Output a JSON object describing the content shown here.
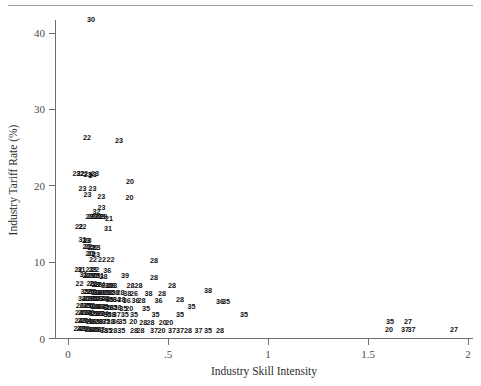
{
  "figure": {
    "top_rule": true,
    "background_color": "#ffffff",
    "marker_color": "#111111",
    "axis_color": "#6f6f6f"
  },
  "chart_data": {
    "type": "scatter",
    "title": "",
    "subtitle": "",
    "xlabel": "Industry Skill Intensity",
    "ylabel": "Industry Tariff Rate (%)",
    "xlim": [
      0,
      2
    ],
    "ylim": [
      0,
      44
    ],
    "grid": false,
    "legend": null,
    "marker_style": "text-label",
    "marker_note": "Each observation is plotted as its 2-digit industry code rather than a symbol",
    "xticks": [
      0,
      0.5,
      1,
      1.5,
      2
    ],
    "xticklabels": [
      "0",
      ".5",
      "1",
      "1.5",
      "2"
    ],
    "yticks": [
      0,
      10,
      20,
      30,
      40
    ],
    "yticklabels": [
      "0",
      "10",
      "20",
      "30",
      "40"
    ],
    "points": [
      {
        "x": 0.115,
        "y": 41.8,
        "label": "30"
      },
      {
        "x": 0.095,
        "y": 26.3,
        "label": "22"
      },
      {
        "x": 0.255,
        "y": 25.9,
        "label": "23"
      },
      {
        "x": 0.042,
        "y": 21.6,
        "label": "23"
      },
      {
        "x": 0.062,
        "y": 21.6,
        "label": "22"
      },
      {
        "x": 0.08,
        "y": 21.6,
        "label": "22"
      },
      {
        "x": 0.098,
        "y": 21.5,
        "label": "23"
      },
      {
        "x": 0.113,
        "y": 21.4,
        "label": "2"
      },
      {
        "x": 0.124,
        "y": 21.5,
        "label": "23"
      },
      {
        "x": 0.135,
        "y": 21.6,
        "label": "23"
      },
      {
        "x": 0.31,
        "y": 20.6,
        "label": "20"
      },
      {
        "x": 0.072,
        "y": 19.6,
        "label": "23"
      },
      {
        "x": 0.122,
        "y": 19.6,
        "label": "23"
      },
      {
        "x": 0.098,
        "y": 18.9,
        "label": "23"
      },
      {
        "x": 0.166,
        "y": 18.6,
        "label": "23"
      },
      {
        "x": 0.308,
        "y": 18.5,
        "label": "20"
      },
      {
        "x": 0.168,
        "y": 17.2,
        "label": "23"
      },
      {
        "x": 0.143,
        "y": 16.6,
        "label": "32"
      },
      {
        "x": 0.108,
        "y": 16.0,
        "label": "23"
      },
      {
        "x": 0.118,
        "y": 16.0,
        "label": "23"
      },
      {
        "x": 0.13,
        "y": 16.0,
        "label": "23"
      },
      {
        "x": 0.15,
        "y": 16.0,
        "label": "21"
      },
      {
        "x": 0.158,
        "y": 16.0,
        "label": "22"
      },
      {
        "x": 0.166,
        "y": 16.0,
        "label": "23"
      },
      {
        "x": 0.176,
        "y": 16.0,
        "label": "29"
      },
      {
        "x": 0.205,
        "y": 15.7,
        "label": "21"
      },
      {
        "x": 0.055,
        "y": 14.7,
        "label": "22"
      },
      {
        "x": 0.072,
        "y": 14.7,
        "label": "22"
      },
      {
        "x": 0.2,
        "y": 14.4,
        "label": "31"
      },
      {
        "x": 0.072,
        "y": 13.0,
        "label": "31"
      },
      {
        "x": 0.09,
        "y": 12.9,
        "label": "23"
      },
      {
        "x": 0.098,
        "y": 12.9,
        "label": "23"
      },
      {
        "x": 0.092,
        "y": 12.0,
        "label": "22"
      },
      {
        "x": 0.102,
        "y": 12.0,
        "label": "22"
      },
      {
        "x": 0.118,
        "y": 11.9,
        "label": "22"
      },
      {
        "x": 0.132,
        "y": 11.9,
        "label": "22"
      },
      {
        "x": 0.142,
        "y": 11.9,
        "label": "23"
      },
      {
        "x": 0.108,
        "y": 11.1,
        "label": "20"
      },
      {
        "x": 0.118,
        "y": 11.1,
        "label": "22"
      },
      {
        "x": 0.14,
        "y": 11.0,
        "label": "23"
      },
      {
        "x": 0.125,
        "y": 10.4,
        "label": "22"
      },
      {
        "x": 0.17,
        "y": 10.3,
        "label": "22"
      },
      {
        "x": 0.212,
        "y": 10.3,
        "label": "22"
      },
      {
        "x": 0.43,
        "y": 10.2,
        "label": "28"
      },
      {
        "x": 0.052,
        "y": 9.1,
        "label": "22"
      },
      {
        "x": 0.068,
        "y": 9.1,
        "label": "31"
      },
      {
        "x": 0.108,
        "y": 9.0,
        "label": "21"
      },
      {
        "x": 0.124,
        "y": 9.0,
        "label": "23"
      },
      {
        "x": 0.136,
        "y": 9.0,
        "label": "22"
      },
      {
        "x": 0.196,
        "y": 8.9,
        "label": "36"
      },
      {
        "x": 0.078,
        "y": 8.4,
        "label": "31"
      },
      {
        "x": 0.092,
        "y": 8.3,
        "label": "22"
      },
      {
        "x": 0.102,
        "y": 8.3,
        "label": "22"
      },
      {
        "x": 0.114,
        "y": 8.3,
        "label": "23"
      },
      {
        "x": 0.128,
        "y": 8.2,
        "label": "35"
      },
      {
        "x": 0.14,
        "y": 8.2,
        "label": "35"
      },
      {
        "x": 0.16,
        "y": 8.2,
        "label": "31"
      },
      {
        "x": 0.178,
        "y": 8.1,
        "label": "28"
      },
      {
        "x": 0.285,
        "y": 8.3,
        "label": "39"
      },
      {
        "x": 0.43,
        "y": 8.0,
        "label": "28"
      },
      {
        "x": 0.058,
        "y": 7.2,
        "label": "22"
      },
      {
        "x": 0.112,
        "y": 7.2,
        "label": "20"
      },
      {
        "x": 0.126,
        "y": 7.2,
        "label": "22"
      },
      {
        "x": 0.138,
        "y": 7.1,
        "label": "23"
      },
      {
        "x": 0.15,
        "y": 7.1,
        "label": "28"
      },
      {
        "x": 0.166,
        "y": 7.1,
        "label": "24"
      },
      {
        "x": 0.186,
        "y": 7.0,
        "label": "22"
      },
      {
        "x": 0.204,
        "y": 7.0,
        "label": "30"
      },
      {
        "x": 0.216,
        "y": 7.0,
        "label": "26"
      },
      {
        "x": 0.226,
        "y": 7.0,
        "label": "28"
      },
      {
        "x": 0.312,
        "y": 7.0,
        "label": "28"
      },
      {
        "x": 0.352,
        "y": 6.9,
        "label": "28"
      },
      {
        "x": 0.52,
        "y": 7.0,
        "label": "28"
      },
      {
        "x": 0.082,
        "y": 6.2,
        "label": "35"
      },
      {
        "x": 0.098,
        "y": 6.2,
        "label": "22"
      },
      {
        "x": 0.112,
        "y": 6.2,
        "label": "20"
      },
      {
        "x": 0.124,
        "y": 6.2,
        "label": "30"
      },
      {
        "x": 0.136,
        "y": 6.1,
        "label": "22"
      },
      {
        "x": 0.148,
        "y": 6.1,
        "label": "34"
      },
      {
        "x": 0.162,
        "y": 6.1,
        "label": "36"
      },
      {
        "x": 0.172,
        "y": 6.1,
        "label": "20"
      },
      {
        "x": 0.188,
        "y": 6.1,
        "label": "35"
      },
      {
        "x": 0.202,
        "y": 6.0,
        "label": "38"
      },
      {
        "x": 0.218,
        "y": 6.0,
        "label": "35"
      },
      {
        "x": 0.236,
        "y": 6.0,
        "label": "28"
      },
      {
        "x": 0.262,
        "y": 6.0,
        "label": "28"
      },
      {
        "x": 0.296,
        "y": 5.9,
        "label": "38"
      },
      {
        "x": 0.33,
        "y": 5.9,
        "label": "26"
      },
      {
        "x": 0.402,
        "y": 5.9,
        "label": "38"
      },
      {
        "x": 0.47,
        "y": 5.9,
        "label": "28"
      },
      {
        "x": 0.7,
        "y": 6.3,
        "label": "38"
      },
      {
        "x": 0.07,
        "y": 5.3,
        "label": "34"
      },
      {
        "x": 0.088,
        "y": 5.3,
        "label": "20"
      },
      {
        "x": 0.1,
        "y": 5.3,
        "label": "22"
      },
      {
        "x": 0.112,
        "y": 5.3,
        "label": "28"
      },
      {
        "x": 0.124,
        "y": 5.2,
        "label": "35"
      },
      {
        "x": 0.138,
        "y": 5.2,
        "label": "30"
      },
      {
        "x": 0.15,
        "y": 5.2,
        "label": "36"
      },
      {
        "x": 0.162,
        "y": 5.2,
        "label": "27"
      },
      {
        "x": 0.176,
        "y": 5.2,
        "label": "34"
      },
      {
        "x": 0.19,
        "y": 5.2,
        "label": "28"
      },
      {
        "x": 0.208,
        "y": 5.1,
        "label": "35"
      },
      {
        "x": 0.224,
        "y": 5.1,
        "label": "36"
      },
      {
        "x": 0.244,
        "y": 5.1,
        "label": "34"
      },
      {
        "x": 0.268,
        "y": 5.1,
        "label": "28"
      },
      {
        "x": 0.294,
        "y": 5.0,
        "label": "36"
      },
      {
        "x": 0.338,
        "y": 5.0,
        "label": "36"
      },
      {
        "x": 0.368,
        "y": 5.0,
        "label": "28"
      },
      {
        "x": 0.452,
        "y": 5.0,
        "label": "36"
      },
      {
        "x": 0.56,
        "y": 5.1,
        "label": "28"
      },
      {
        "x": 0.76,
        "y": 4.9,
        "label": "36"
      },
      {
        "x": 0.79,
        "y": 4.9,
        "label": "35"
      },
      {
        "x": 0.06,
        "y": 4.3,
        "label": "26"
      },
      {
        "x": 0.078,
        "y": 4.3,
        "label": "22"
      },
      {
        "x": 0.092,
        "y": 4.3,
        "label": "35"
      },
      {
        "x": 0.106,
        "y": 4.3,
        "label": "20"
      },
      {
        "x": 0.118,
        "y": 4.3,
        "label": "30"
      },
      {
        "x": 0.13,
        "y": 4.2,
        "label": "34"
      },
      {
        "x": 0.142,
        "y": 4.2,
        "label": "28"
      },
      {
        "x": 0.156,
        "y": 4.2,
        "label": "36"
      },
      {
        "x": 0.168,
        "y": 4.2,
        "label": "24"
      },
      {
        "x": 0.182,
        "y": 4.2,
        "label": "35"
      },
      {
        "x": 0.196,
        "y": 4.1,
        "label": "30"
      },
      {
        "x": 0.21,
        "y": 4.1,
        "label": "26"
      },
      {
        "x": 0.228,
        "y": 4.1,
        "label": "35"
      },
      {
        "x": 0.248,
        "y": 4.1,
        "label": "28"
      },
      {
        "x": 0.276,
        "y": 4.0,
        "label": "35"
      },
      {
        "x": 0.306,
        "y": 4.0,
        "label": "20"
      },
      {
        "x": 0.39,
        "y": 4.0,
        "label": "35"
      },
      {
        "x": 0.618,
        "y": 4.2,
        "label": "35"
      },
      {
        "x": 0.055,
        "y": 3.4,
        "label": "24"
      },
      {
        "x": 0.07,
        "y": 3.4,
        "label": "20"
      },
      {
        "x": 0.084,
        "y": 3.4,
        "label": "22"
      },
      {
        "x": 0.098,
        "y": 3.4,
        "label": "34"
      },
      {
        "x": 0.112,
        "y": 3.4,
        "label": "30"
      },
      {
        "x": 0.124,
        "y": 3.3,
        "label": "35"
      },
      {
        "x": 0.138,
        "y": 3.3,
        "label": "28"
      },
      {
        "x": 0.152,
        "y": 3.3,
        "label": "36"
      },
      {
        "x": 0.166,
        "y": 3.3,
        "label": "20"
      },
      {
        "x": 0.182,
        "y": 3.3,
        "label": "34"
      },
      {
        "x": 0.198,
        "y": 3.2,
        "label": "35"
      },
      {
        "x": 0.218,
        "y": 3.2,
        "label": "28"
      },
      {
        "x": 0.244,
        "y": 3.2,
        "label": "37"
      },
      {
        "x": 0.284,
        "y": 3.2,
        "label": "35"
      },
      {
        "x": 0.33,
        "y": 3.2,
        "label": "35"
      },
      {
        "x": 0.438,
        "y": 3.1,
        "label": "35"
      },
      {
        "x": 0.56,
        "y": 3.1,
        "label": "35"
      },
      {
        "x": 0.88,
        "y": 3.1,
        "label": "35"
      },
      {
        "x": 0.052,
        "y": 2.4,
        "label": "24"
      },
      {
        "x": 0.068,
        "y": 2.4,
        "label": "22"
      },
      {
        "x": 0.082,
        "y": 2.4,
        "label": "20"
      },
      {
        "x": 0.096,
        "y": 2.4,
        "label": "34"
      },
      {
        "x": 0.11,
        "y": 2.3,
        "label": "28"
      },
      {
        "x": 0.124,
        "y": 2.3,
        "label": "36"
      },
      {
        "x": 0.14,
        "y": 2.3,
        "label": "35"
      },
      {
        "x": 0.156,
        "y": 2.3,
        "label": "30"
      },
      {
        "x": 0.172,
        "y": 2.3,
        "label": "37"
      },
      {
        "x": 0.19,
        "y": 2.2,
        "label": "35"
      },
      {
        "x": 0.212,
        "y": 2.2,
        "label": "28"
      },
      {
        "x": 0.24,
        "y": 2.2,
        "label": "36"
      },
      {
        "x": 0.272,
        "y": 2.2,
        "label": "35"
      },
      {
        "x": 0.326,
        "y": 2.2,
        "label": "20"
      },
      {
        "x": 0.376,
        "y": 2.1,
        "label": "28"
      },
      {
        "x": 0.412,
        "y": 2.1,
        "label": "28"
      },
      {
        "x": 0.474,
        "y": 2.1,
        "label": "20"
      },
      {
        "x": 0.506,
        "y": 2.1,
        "label": "20"
      },
      {
        "x": 0.048,
        "y": 1.3,
        "label": "24"
      },
      {
        "x": 0.062,
        "y": 1.3,
        "label": "22"
      },
      {
        "x": 0.076,
        "y": 1.3,
        "label": "20"
      },
      {
        "x": 0.09,
        "y": 1.3,
        "label": "30"
      },
      {
        "x": 0.104,
        "y": 1.2,
        "label": "28"
      },
      {
        "x": 0.118,
        "y": 1.2,
        "label": "34"
      },
      {
        "x": 0.132,
        "y": 1.2,
        "label": "35"
      },
      {
        "x": 0.148,
        "y": 1.2,
        "label": "36"
      },
      {
        "x": 0.164,
        "y": 1.2,
        "label": "37"
      },
      {
        "x": 0.18,
        "y": 1.1,
        "label": "38"
      },
      {
        "x": 0.2,
        "y": 1.1,
        "label": "35"
      },
      {
        "x": 0.226,
        "y": 1.1,
        "label": "28"
      },
      {
        "x": 0.266,
        "y": 1.1,
        "label": "35"
      },
      {
        "x": 0.33,
        "y": 1.1,
        "label": "28"
      },
      {
        "x": 0.362,
        "y": 1.0,
        "label": "28"
      },
      {
        "x": 0.43,
        "y": 1.0,
        "label": "37"
      },
      {
        "x": 0.468,
        "y": 1.0,
        "label": "20"
      },
      {
        "x": 0.52,
        "y": 1.0,
        "label": "37"
      },
      {
        "x": 0.56,
        "y": 1.0,
        "label": "37"
      },
      {
        "x": 0.6,
        "y": 1.0,
        "label": "28"
      },
      {
        "x": 0.652,
        "y": 1.0,
        "label": "37"
      },
      {
        "x": 0.7,
        "y": 1.0,
        "label": "35"
      },
      {
        "x": 0.76,
        "y": 1.0,
        "label": "28"
      },
      {
        "x": 1.61,
        "y": 2.3,
        "label": "35"
      },
      {
        "x": 1.7,
        "y": 2.3,
        "label": "27"
      },
      {
        "x": 1.605,
        "y": 1.2,
        "label": "20"
      },
      {
        "x": 1.685,
        "y": 1.2,
        "label": "37"
      },
      {
        "x": 1.718,
        "y": 1.2,
        "label": "37"
      },
      {
        "x": 1.93,
        "y": 1.2,
        "label": "27"
      }
    ]
  }
}
